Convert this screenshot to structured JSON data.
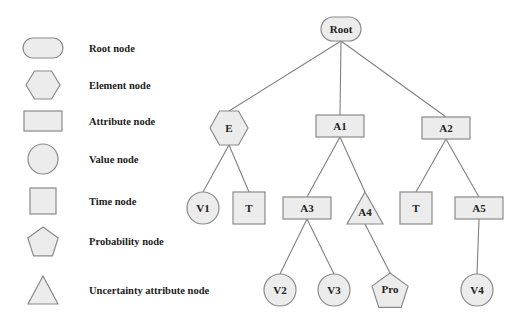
{
  "legend": [
    {
      "shape": "root",
      "label": "Root node"
    },
    {
      "shape": "element",
      "label": "Element node"
    },
    {
      "shape": "attribute",
      "label": "Attribute node"
    },
    {
      "shape": "value",
      "label": "Value node"
    },
    {
      "shape": "time",
      "label": "Time node"
    },
    {
      "shape": "probability",
      "label": "Probability node"
    },
    {
      "shape": "uncertainty",
      "label": "Uncertainty attribute node"
    }
  ],
  "tree": {
    "nodes": [
      {
        "id": "root",
        "label": "Root",
        "shape": "root"
      },
      {
        "id": "e",
        "label": "E",
        "shape": "element"
      },
      {
        "id": "a1",
        "label": "A1",
        "shape": "attribute"
      },
      {
        "id": "a2",
        "label": "A2",
        "shape": "attribute"
      },
      {
        "id": "v1",
        "label": "V1",
        "shape": "value"
      },
      {
        "id": "t1",
        "label": "T",
        "shape": "time"
      },
      {
        "id": "a3",
        "label": "A3",
        "shape": "attribute"
      },
      {
        "id": "a4",
        "label": "A4",
        "shape": "uncertainty"
      },
      {
        "id": "t2",
        "label": "T",
        "shape": "time"
      },
      {
        "id": "a5",
        "label": "A5",
        "shape": "attribute"
      },
      {
        "id": "v2",
        "label": "V2",
        "shape": "value"
      },
      {
        "id": "v3",
        "label": "V3",
        "shape": "value"
      },
      {
        "id": "pro",
        "label": "Pro",
        "shape": "probability"
      },
      {
        "id": "v4",
        "label": "V4",
        "shape": "value"
      }
    ],
    "edges": [
      [
        "root",
        "e"
      ],
      [
        "root",
        "a1"
      ],
      [
        "root",
        "a2"
      ],
      [
        "e",
        "v1"
      ],
      [
        "e",
        "t1"
      ],
      [
        "a1",
        "a3"
      ],
      [
        "a1",
        "a4"
      ],
      [
        "a2",
        "t2"
      ],
      [
        "a2",
        "a5"
      ],
      [
        "a3",
        "v2"
      ],
      [
        "a3",
        "v3"
      ],
      [
        "a4",
        "pro"
      ],
      [
        "a5",
        "v4"
      ]
    ]
  }
}
